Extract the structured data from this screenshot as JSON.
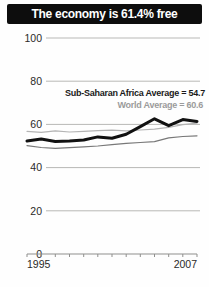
{
  "title": {
    "text": "The economy is 61.4% free"
  },
  "colors": {
    "title_bar_bg": "#0d0d0d",
    "title_text": "#ffffff",
    "country_line": "#111111",
    "ssa_line": "#787878",
    "world_line": "#b4b4b4",
    "gridline": "#b8b8b6"
  },
  "chart_data": {
    "type": "line",
    "title": "The economy is 61.4% free",
    "x": [
      1995,
      1996,
      1997,
      1998,
      1999,
      2000,
      2001,
      2002,
      2003,
      2004,
      2005,
      2006,
      2007
    ],
    "series": [
      {
        "id": "world-average",
        "name": "World Average",
        "color": "#b4b4b4",
        "width": 1.2,
        "values": [
          56.8,
          56.3,
          57.0,
          56.5,
          56.8,
          57.1,
          57.3,
          57.0,
          57.4,
          57.8,
          58.6,
          59.9,
          60.6
        ]
      },
      {
        "id": "ssa-average",
        "name": "Sub-Saharan Africa Average",
        "color": "#787878",
        "width": 1.2,
        "values": [
          50.2,
          49.3,
          48.9,
          49.2,
          49.6,
          50.0,
          50.6,
          51.2,
          51.6,
          52.0,
          53.8,
          54.4,
          54.7
        ]
      },
      {
        "id": "country-score",
        "name": "Country economic freedom score",
        "color": "#111111",
        "width": 3,
        "values": [
          52.3,
          53.2,
          52.1,
          52.3,
          52.8,
          54.2,
          53.6,
          55.4,
          59.0,
          62.6,
          59.4,
          62.2,
          61.4
        ]
      }
    ],
    "annotations": [
      {
        "text": "Sub-Saharan Africa Average = 54.7",
        "color": "#1a1a1a"
      },
      {
        "text": "World Average = 60.6",
        "color": "#9b9b9b"
      }
    ],
    "yticks": [
      100,
      80,
      60,
      40,
      20,
      0
    ],
    "xtick_labels": [
      "1995",
      "2007"
    ],
    "ylim": [
      0,
      100
    ],
    "grid": true,
    "legend": "none"
  }
}
